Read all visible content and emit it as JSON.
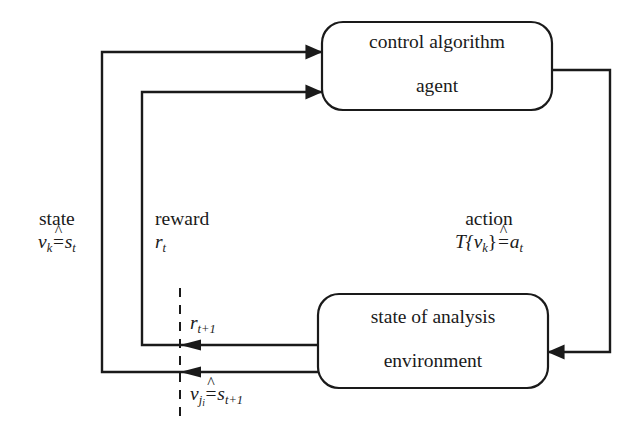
{
  "diagram": {
    "stroke_color": "#1a1a1a",
    "background_color": "#ffffff",
    "nodes": [
      {
        "id": "agent",
        "name": "agent-box",
        "line1": "control algorithm",
        "line2": "agent"
      },
      {
        "id": "environment",
        "name": "environment-box",
        "line1": "state of analysis",
        "line2": "environment"
      }
    ],
    "edges": [
      {
        "id": "state",
        "word": "state",
        "symbol_left": "v",
        "symbol_left_sub": "k",
        "corresponds": "≙",
        "symbol_right": "s",
        "symbol_right_sub": "t"
      },
      {
        "id": "reward",
        "word": "reward",
        "symbol": "r",
        "symbol_sub": "t"
      },
      {
        "id": "action",
        "word": "action",
        "symbol_left": "T{v",
        "symbol_left_sub": "k",
        "symbol_left_close": "}",
        "corresponds": "≙",
        "symbol_right": "a",
        "symbol_right_sub": "t"
      }
    ],
    "annotations": [
      {
        "id": "reward-next",
        "symbol": "r",
        "symbol_sub": "t+1"
      },
      {
        "id": "state-next",
        "symbol_left": "v",
        "symbol_left_sub": "j",
        "symbol_left_subsub": "i",
        "corresponds": "≙",
        "symbol_right": "s",
        "symbol_right_sub": "t+1"
      }
    ],
    "timestep_divider": {
      "id": "timestep-divider",
      "style": "dashed-vertical"
    }
  }
}
